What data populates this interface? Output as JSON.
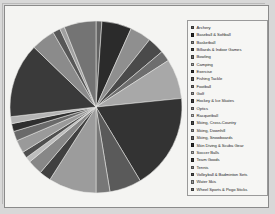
{
  "chart_data": {
    "type": "pie",
    "title": "",
    "legend_position": "right",
    "grid": false,
    "start_angle_deg": -90,
    "direction": "clockwise",
    "categories": [
      "Archery",
      "Baseball & Softball",
      "Basketball",
      "Billiards & Indoor Games",
      "Bowling",
      "Camping",
      "Exercise",
      "Fishing Tackle",
      "Football",
      "Golf",
      "Hockey & Ice Skates",
      "Optics",
      "Racquetball",
      "Skiing, Cross-Country",
      "Skiing, Downhill",
      "Skiing, Snowboards",
      "Skin Diving & Scuba Gear",
      "Soccer Balls",
      "Team Goods",
      "Tennis",
      "Volleyball & Badminton Sets",
      "Water Skis",
      "Wheel Sports & Pogo Sticks"
    ],
    "values": [
      1.1,
      5.6,
      4.0,
      3.2,
      2.0,
      7.5,
      18.0,
      6.0,
      2.6,
      9.0,
      2.2,
      2.8,
      1.0,
      1.2,
      2.4,
      1.8,
      1.5,
      1.3,
      14.0,
      4.5,
      1.4,
      0.9,
      6.0
    ],
    "colors": [
      "#636363",
      "#2b2b2b",
      "#8f8f8f",
      "#4a4a4a",
      "#6e6e6e",
      "#a8a8a8",
      "#333333",
      "#5a5a5a",
      "#777777",
      "#9c9c9c",
      "#404040",
      "#878787",
      "#bdbdbd",
      "#4f4f4f",
      "#9a9a9a",
      "#6a6a6a",
      "#2f2f2f",
      "#b4b4b4",
      "#3a3a3a",
      "#8b8b8b",
      "#575757",
      "#a0a0a0",
      "#747474"
    ]
  },
  "legend": {
    "marker_icon": "square-swatch"
  }
}
